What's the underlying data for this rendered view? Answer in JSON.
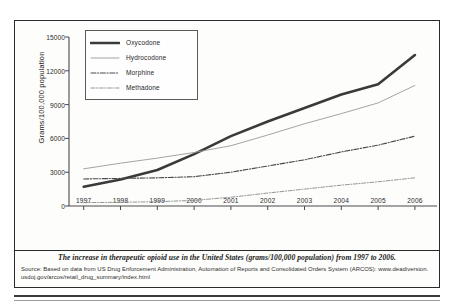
{
  "figure": {
    "caption": "The increase in therapeutic opioid use in the United States (grams/100,000 population) from 1997 to 2006.",
    "source_line_1": "Source: Based on data from US Drug Enforcement Administration, Automation of Reports and Consolidated Orders System (ARCOS): www.deadiversion.",
    "source_line_2": "usdoj.gov/arcos/retail_drug_summary/index.html"
  },
  "chart_data": {
    "type": "line",
    "title": "",
    "xlabel": "",
    "ylabel": "Grams/100,000 population",
    "x": [
      1997,
      1998,
      1999,
      2000,
      2001,
      2002,
      2003,
      2004,
      2005,
      2006
    ],
    "xtick_labels": [
      "1997",
      "1998",
      "1999",
      "2000",
      "2001",
      "2002",
      "2003",
      "2004",
      "2005",
      "2006"
    ],
    "ytick_labels": [
      "0",
      "3000",
      "6000",
      "9000",
      "12000",
      "15000"
    ],
    "ytick_values": [
      0,
      3000,
      6000,
      9000,
      12000,
      15000
    ],
    "xlim": [
      1996.6,
      2006.6
    ],
    "ylim": [
      0,
      15000
    ],
    "grid": false,
    "legend_position": "upper-left-inside",
    "series": [
      {
        "name": "Oxycodone",
        "style": "solid-thick",
        "color": "#3a3a3a",
        "values": [
          1700,
          2350,
          3200,
          4600,
          6200,
          7500,
          8700,
          9900,
          10800,
          13400
        ]
      },
      {
        "name": "Hydrocodone",
        "style": "thin-light",
        "color": "#9a9a9a",
        "values": [
          3300,
          3800,
          4250,
          4750,
          5350,
          6300,
          7300,
          8200,
          9150,
          10700
        ]
      },
      {
        "name": "Morphine",
        "style": "dash-dot",
        "color": "#4a4a4a",
        "values": [
          2400,
          2450,
          2500,
          2600,
          3000,
          3550,
          4100,
          4800,
          5400,
          6200
        ]
      },
      {
        "name": "Methadone",
        "style": "dash-dot-thin",
        "color": "#8a8a8a",
        "values": [
          300,
          330,
          380,
          500,
          780,
          1150,
          1500,
          1850,
          2150,
          2500
        ]
      }
    ]
  }
}
